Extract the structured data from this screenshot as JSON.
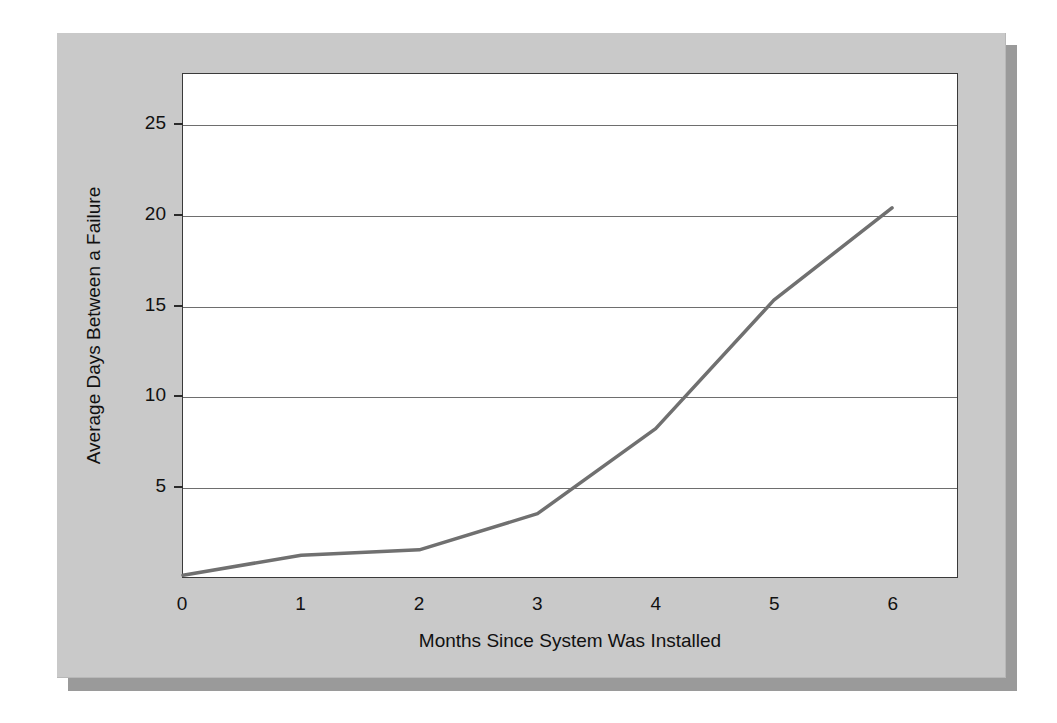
{
  "figure": {
    "background_color": "#ffffff",
    "panel_color": "#c9c9c9",
    "panel_shadow_color": "#9a9a9a",
    "plot_background_color": "#ffffff",
    "frame_color": "#3a3a3a",
    "gridline_color": "#6e6e6e",
    "line_color": "#707070"
  },
  "chart_data": {
    "type": "line",
    "title": "",
    "subtitle": "",
    "xlabel": "Months Since System Was Installed",
    "ylabel": "Average Days Between a Failure",
    "x": [
      0,
      1,
      2,
      3,
      4,
      5,
      6
    ],
    "series": [
      {
        "name": "Average days between a failure",
        "values": [
          0.1,
          1.2,
          1.5,
          3.5,
          8.2,
          15.3,
          20.4
        ],
        "color": "#707070",
        "line_width": 3.5
      }
    ],
    "xlim": [
      0,
      6.55
    ],
    "ylim": [
      0,
      27.8
    ],
    "xticks": [
      0,
      1,
      2,
      3,
      4,
      5,
      6
    ],
    "xtick_labels": [
      "0",
      "1",
      "2",
      "3",
      "4",
      "5",
      "6"
    ],
    "yticks": [
      5,
      10,
      15,
      20,
      25
    ],
    "ytick_labels": [
      "5",
      "10",
      "15",
      "20",
      "25"
    ],
    "ytick_label_zero": "0",
    "grid": true,
    "grid_axis": "y",
    "legend": false,
    "legend_position": "none",
    "annotations": []
  }
}
